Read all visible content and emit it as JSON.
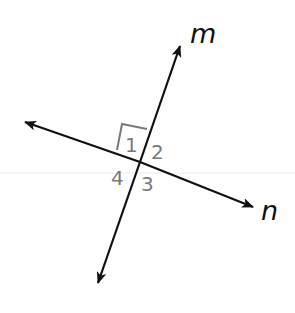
{
  "diagram": {
    "lines": [
      {
        "name": "m",
        "label": "m",
        "from": [
          98,
          283
        ],
        "to": [
          180,
          46
        ]
      },
      {
        "name": "n",
        "label": "n",
        "from": [
          25,
          122
        ],
        "to": [
          253,
          207
        ]
      }
    ],
    "intersection": [
      140,
      162
    ],
    "angle_labels": [
      {
        "id": "1",
        "text": "1"
      },
      {
        "id": "2",
        "text": "2"
      },
      {
        "id": "3",
        "text": "3"
      },
      {
        "id": "4",
        "text": "4"
      }
    ],
    "right_angle_marker": {
      "angle": "1"
    },
    "colors": {
      "line": "#111111",
      "angle_label": "#7a7a7a",
      "marker": "#7a7a7a",
      "guide": "#f2f2f2"
    }
  }
}
